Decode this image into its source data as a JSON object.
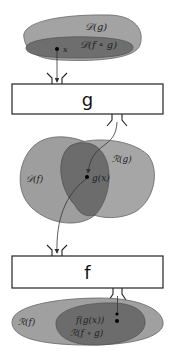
{
  "diagram": {
    "colors": {
      "outer_region": "#9a9a9a",
      "inner_region": "#6b6b6b",
      "outline": "#555555",
      "box_fill": "#ffffff",
      "box_stroke": "#222222",
      "arrow": "#333333",
      "point": "#000000"
    },
    "top_sets": {
      "outer_label": "𝒟(g)",
      "inner_label": "𝒟(f ∘ g)",
      "point_label": "x"
    },
    "box_g": {
      "label": "g"
    },
    "middle_sets": {
      "left_label": "𝒟(f)",
      "right_label": "ℛ(g)",
      "point_label": "g(x)"
    },
    "box_f": {
      "label": "f"
    },
    "bottom_sets": {
      "outer_label": "ℛ(f)",
      "point_label": "f(g(x))",
      "inner_label": "ℛ(f ∘ g)"
    }
  }
}
